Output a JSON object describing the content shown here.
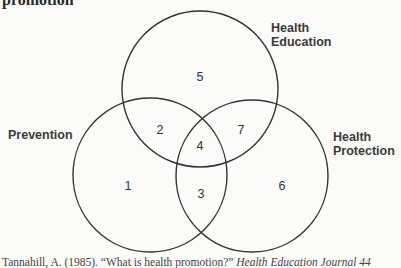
{
  "title": "promotion",
  "diagram": {
    "type": "venn",
    "sets": [
      {
        "label_line1": "Health",
        "label_line2": "Education"
      },
      {
        "label": "Prevention"
      },
      {
        "label_line1": "Health",
        "label_line2": "Protection"
      }
    ],
    "regions": [
      "1",
      "2",
      "3",
      "4",
      "5",
      "6",
      "7"
    ]
  },
  "caption": {
    "text": "Tannahill, A. (1985). “What is health promotion?”",
    "journal": "Health Education Journal 44"
  }
}
